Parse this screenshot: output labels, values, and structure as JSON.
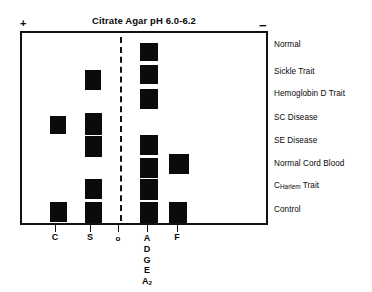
{
  "figure": {
    "title": "Citrate Agar pH 6.0-6.2",
    "anode_marker": "+",
    "cathode_marker": "−",
    "origin_marker_label": "o"
  },
  "axis": {
    "positions": [
      {
        "name": "c-position",
        "x": 55,
        "label": "C",
        "stack": null
      },
      {
        "name": "s-position",
        "x": 90,
        "label": "S",
        "stack": null
      },
      {
        "name": "origin-position",
        "x": 118,
        "label": "o",
        "stack": null
      },
      {
        "name": "a-position",
        "x": 147,
        "label": "A",
        "stack": [
          "D",
          "G",
          "E",
          "A2"
        ]
      },
      {
        "name": "f-position",
        "x": 177,
        "label": "F",
        "stack": null
      }
    ],
    "a_stack_subscript_base": "A",
    "a_stack_subscript": "2"
  },
  "samples": [
    {
      "label": "Normal",
      "label_prefix": null,
      "label_subscript": null,
      "label_suffix": null,
      "y": 41,
      "bands": [
        {
          "column": "A",
          "x": 138,
          "y": 41,
          "w": 18,
          "h": 18
        }
      ]
    },
    {
      "label": "Sickle Trait",
      "label_prefix": null,
      "label_subscript": null,
      "label_suffix": null,
      "y": 68,
      "bands": [
        {
          "column": "S",
          "x": 83,
          "y": 68,
          "w": 16,
          "h": 20
        },
        {
          "column": "A",
          "x": 138,
          "y": 63,
          "w": 18,
          "h": 19
        }
      ]
    },
    {
      "label": "Hemoglobin D Trait",
      "label_prefix": null,
      "label_subscript": null,
      "label_suffix": null,
      "y": 90,
      "bands": [
        {
          "column": "A",
          "x": 138,
          "y": 87,
          "w": 18,
          "h": 20
        }
      ]
    },
    {
      "label": "SC Disease",
      "label_prefix": null,
      "label_subscript": null,
      "label_suffix": null,
      "y": 114,
      "bands": [
        {
          "column": "C",
          "x": 48,
          "y": 114,
          "w": 16,
          "h": 18
        },
        {
          "column": "S",
          "x": 83,
          "y": 111,
          "w": 17,
          "h": 22
        }
      ]
    },
    {
      "label": "SE Disease",
      "label_prefix": null,
      "label_subscript": null,
      "label_suffix": null,
      "y": 137,
      "bands": [
        {
          "column": "S",
          "x": 83,
          "y": 134,
          "w": 17,
          "h": 21
        },
        {
          "column": "A",
          "x": 138,
          "y": 133,
          "w": 18,
          "h": 20
        }
      ]
    },
    {
      "label": "Normal Cord Blood",
      "label_prefix": null,
      "label_subscript": null,
      "label_suffix": null,
      "y": 160,
      "bands": [
        {
          "column": "A",
          "x": 138,
          "y": 156,
          "w": 18,
          "h": 20
        },
        {
          "column": "F",
          "x": 167,
          "y": 152,
          "w": 20,
          "h": 20
        }
      ]
    },
    {
      "label": "CHarlem Trait",
      "label_prefix": "C",
      "label_subscript": "Harlem",
      "label_suffix": " Trait",
      "y": 182,
      "bands": [
        {
          "column": "S",
          "x": 83,
          "y": 177,
          "w": 17,
          "h": 20
        },
        {
          "column": "A",
          "x": 138,
          "y": 177,
          "w": 18,
          "h": 21
        }
      ]
    },
    {
      "label": "Control",
      "label_prefix": null,
      "label_subscript": null,
      "label_suffix": null,
      "y": 206,
      "bands": [
        {
          "column": "C",
          "x": 48,
          "y": 200,
          "w": 17,
          "h": 20
        },
        {
          "column": "S",
          "x": 83,
          "y": 200,
          "w": 17,
          "h": 21
        },
        {
          "column": "A",
          "x": 138,
          "y": 200,
          "w": 18,
          "h": 21
        },
        {
          "column": "F",
          "x": 167,
          "y": 200,
          "w": 18,
          "h": 21
        }
      ]
    }
  ],
  "colors": {
    "band": "#0b0b0b",
    "plate_border": "#111111",
    "text": "#0a0a0a",
    "background": "#ffffff"
  }
}
